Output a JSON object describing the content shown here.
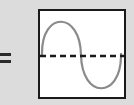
{
  "diagram": {
    "operator": "=",
    "panel": {
      "waveform": "sine",
      "cycles": 1,
      "axis": "dashed-horizontal-centerline",
      "colors": {
        "wave": "#8a8a8a",
        "axis": "#1a1a1a",
        "border": "#1a1a1a",
        "background": "#ffffff"
      }
    }
  }
}
